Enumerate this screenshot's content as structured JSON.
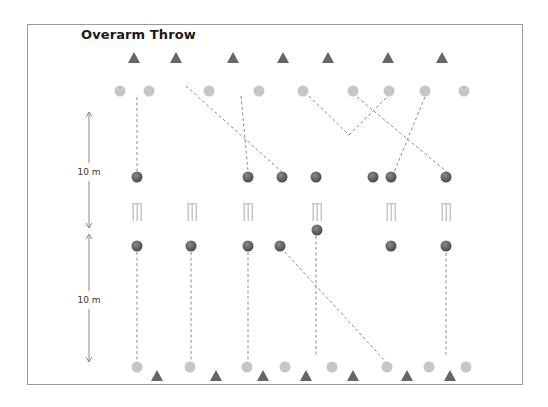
{
  "title": "Overarm Throw",
  "distance_labels": [
    "10 m",
    "10 m"
  ],
  "colors": {
    "triangle": "#666666",
    "light_circle": "#c6c6c6",
    "ball_dark": "#4f4f4f",
    "ball_light": "#8a8a8a",
    "wicket": "#c8c8c8",
    "dashed_line": "#8c8c8c",
    "arrow": "#8a8a8a"
  },
  "legend_of_symbols": {
    "triangle": "cone-marker",
    "light_circle": "player",
    "dark_ball": "ball",
    "wicket": "wicket"
  },
  "rows": {
    "top_cones": 7,
    "top_players": 9,
    "upper_balls": 7,
    "wickets": 6,
    "lower_balls": 7,
    "bottom_players": 8,
    "bottom_cones": 7
  }
}
